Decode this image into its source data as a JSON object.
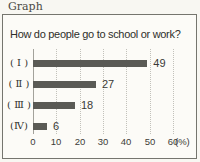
{
  "meta": {
    "page_label": "Graph"
  },
  "colors": {
    "bar": "#5a5a55",
    "box_background": "#fcfbf7",
    "box_border": "#75756e",
    "gridline": "#c2c1ba"
  },
  "chart_data": {
    "type": "bar",
    "orientation": "horizontal",
    "title": "How do people go to school or work?",
    "categories": [
      "( Ⅰ )",
      "( Ⅱ )",
      "( Ⅲ )",
      "(Ⅳ)"
    ],
    "values": [
      49,
      27,
      18,
      6
    ],
    "xlabel": "(%)",
    "ylabel": "",
    "xlim": [
      0,
      60
    ],
    "tick_labels": [
      "0",
      "10",
      "20",
      "30",
      "40",
      "50",
      "60"
    ],
    "unit_label": "(%)",
    "grid": "dotted vertical gridlines at each x tick",
    "legend": "none"
  }
}
